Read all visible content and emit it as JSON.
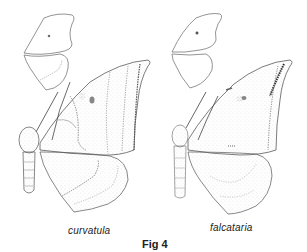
{
  "figure": {
    "label": "Fig 4",
    "specimens": [
      {
        "name": "curvatula",
        "position": "left"
      },
      {
        "name": "falcataria",
        "position": "right"
      }
    ]
  },
  "colors": {
    "ink": "#333333",
    "shade": "#666666",
    "background": "#ffffff"
  }
}
